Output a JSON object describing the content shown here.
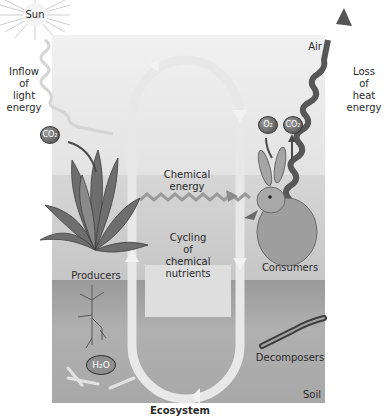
{
  "diagram": {
    "title": "Ecosystem",
    "zones": {
      "air": "Air",
      "soil": "Soil"
    },
    "labels": {
      "sun": "Sun",
      "inflow": [
        "Inflow",
        "of",
        "light",
        "energy"
      ],
      "loss": [
        "Loss",
        "of",
        "heat",
        "energy"
      ],
      "chemical_energy": [
        "Chemical",
        "energy"
      ],
      "cycling": [
        "Cycling",
        "of",
        "chemical",
        "nutrients"
      ],
      "producers": "Producers",
      "consumers": "Consumers",
      "decomposers": "Decomposers"
    },
    "molecules": {
      "co2_producer": "CO₂",
      "o2": "O₂",
      "co2_consumer": "CO₂",
      "h2o": "H₂O"
    },
    "colors": {
      "air": "#ececec",
      "soil": "#a3a3a3",
      "cycle_arrow": "#e6e6e6",
      "heat_arrow": "#555555"
    }
  }
}
